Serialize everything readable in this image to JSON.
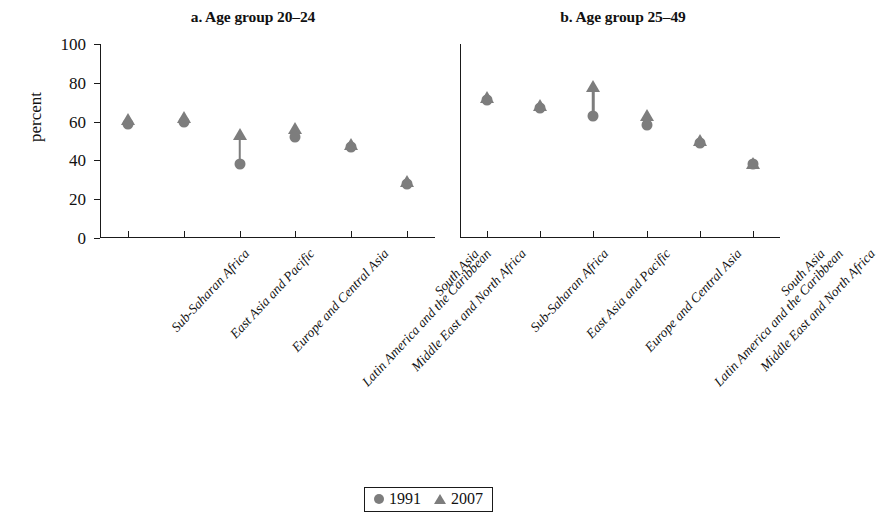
{
  "chart_data": {
    "type": "scatter",
    "title": "",
    "ylabel": "percent",
    "xlabel": "",
    "ylim": [
      0,
      100
    ],
    "yticks": [
      0,
      20,
      40,
      60,
      80,
      100
    ],
    "grid": false,
    "legend_position": "bottom-center",
    "legend": [
      {
        "label": "1991",
        "marker": "circle",
        "color": "#7d7d7d"
      },
      {
        "label": "2007",
        "marker": "triangle",
        "color": "#7d7d7d"
      }
    ],
    "categories": [
      "Sub-Saharan Africa",
      "East Asia and Pacific",
      "Europe and Central Asia",
      "Latin America and the Caribbean",
      "Middle East and North Africa",
      "South Asia"
    ],
    "panels": [
      {
        "title": "a. Age group 20–24",
        "series": [
          {
            "name": "1991",
            "values": [
              59,
              60,
              38,
              52,
              47,
              28
            ]
          },
          {
            "name": "2007",
            "values": [
              61,
              62,
              53,
              56,
              48,
              29
            ]
          }
        ]
      },
      {
        "title": "b. Age group 25–49",
        "series": [
          {
            "name": "1991",
            "values": [
              71,
              67,
              63,
              58,
              49,
              38
            ]
          },
          {
            "name": "2007",
            "values": [
              72,
              68,
              78,
              63,
              50,
              38
            ]
          }
        ]
      }
    ]
  },
  "panel_a": {
    "title": "a. Age group 20–24",
    "axis": {
      "ylabel": "percent",
      "ytick_labels": [
        "100",
        "80",
        "60",
        "40",
        "20",
        "0"
      ],
      "xtick_labels": [
        "Sub-Saharan Africa",
        "East Asia and Pacific",
        "Europe and Central Asia",
        "Latin America and the Caribbean",
        "Middle East and North Africa",
        "South Asia"
      ]
    }
  },
  "panel_b": {
    "title": "b. Age group 25–49",
    "axis": {
      "xtick_labels": [
        "Sub-Saharan Africa",
        "East Asia and Pacific",
        "Europe and Central Asia",
        "Latin America and the Caribbean",
        "Middle East and North Africa",
        "South Asia"
      ]
    }
  },
  "legend": {
    "item_1991": "1991",
    "item_2007": "2007",
    "marker_1991": "circle-marker-icon",
    "marker_2007": "triangle-marker-icon"
  },
  "colors": {
    "marker": "#7d7d7d",
    "axis": "#1a1a1a",
    "background": "#ffffff"
  }
}
